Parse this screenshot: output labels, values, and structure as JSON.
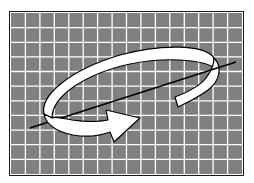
{
  "diagram": {
    "grid": {
      "columns": 16,
      "rows": 11,
      "cell_color": "#808080",
      "line_color": "#ffffff"
    },
    "axis_line": {
      "color": "#000000"
    },
    "arrow": {
      "fill": "#ffffff",
      "stroke": "#000000",
      "direction": "clockwise-around-axis"
    },
    "icons": [
      "rotation-arrow-icon",
      "axis-line-icon",
      "grid-background-icon"
    ]
  }
}
